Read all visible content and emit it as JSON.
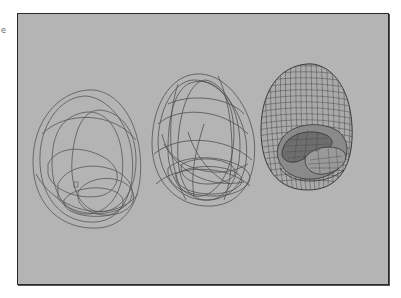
{
  "page": {
    "edge_mark": "e"
  },
  "figure": {
    "background_color": "#b4b4b4",
    "border_color": "#2a2a2a",
    "line_color": "#4a4a4a",
    "panels": [
      {
        "id": "sparse-wireframe",
        "description": "Sparse wireframe of egg-shaped shell with few curves"
      },
      {
        "id": "medium-wireframe",
        "description": "Medium density wireframe of egg-shaped shell"
      },
      {
        "id": "dense-mesh",
        "description": "Dense grid mesh of egg-shaped shell with inner lobed object"
      }
    ]
  }
}
